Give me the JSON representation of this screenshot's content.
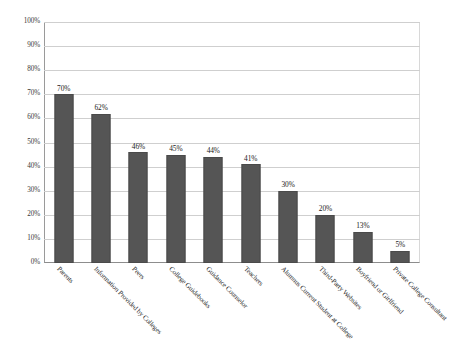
{
  "chart_data": {
    "type": "bar",
    "title": "",
    "subtitle": "",
    "xlabel": "",
    "ylabel": "",
    "ylim": [
      0,
      100
    ],
    "yticks": [
      "0%",
      "10%",
      "20%",
      "30%",
      "40%",
      "50%",
      "60%",
      "70%",
      "80%",
      "90%",
      "100%"
    ],
    "ytick_values": [
      0,
      10,
      20,
      30,
      40,
      50,
      60,
      70,
      80,
      90,
      100
    ],
    "grid": true,
    "legend": false,
    "legend_position": "none",
    "orientation": "vertical",
    "value_label_suffix": "%",
    "categories": [
      "Parents",
      "Information Provided by Colleges",
      "Peers",
      "College Guidebooks",
      "Guidance Counselor",
      "Teachers",
      "Alumnus Current Student at College",
      "Third-Party Websites",
      "Boyfriend or Girlfriend",
      "Private College Consultant"
    ],
    "values": [
      70,
      62,
      46,
      45,
      44,
      41,
      30,
      20,
      13,
      5
    ],
    "value_labels": [
      "70%",
      "62%",
      "46%",
      "45%",
      "44%",
      "41%",
      "30%",
      "20%",
      "13%",
      "5%"
    ],
    "colors": {
      "bar": "#555555",
      "bar_border": "#4a4a4a",
      "gridline": "#cfcfcf",
      "axis": "#8d8d8d",
      "background": "#ffffff",
      "text": "#1b1b1b"
    }
  }
}
